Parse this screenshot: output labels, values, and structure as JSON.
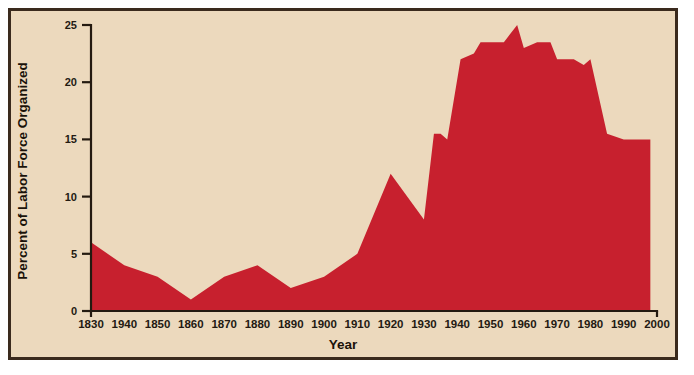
{
  "figure": {
    "background_color": "#ecd9bd",
    "border_color": "#3a2a1d",
    "series_color": "#c7202e",
    "axis_color": "#241a10"
  },
  "chart_data": {
    "type": "area",
    "title": "",
    "xlabel": "Year",
    "ylabel": "Percent of Labor Force Organized",
    "xlim": [
      1830,
      2000
    ],
    "ylim": [
      0,
      25
    ],
    "grid": false,
    "legend": null,
    "xticks": [
      1830,
      1940,
      1850,
      1860,
      1870,
      1880,
      1890,
      1900,
      1910,
      1920,
      1930,
      1940,
      1950,
      1960,
      1970,
      1980,
      1990,
      2000
    ],
    "xtick_labels": [
      "1830",
      "1940",
      "1850",
      "1860",
      "1870",
      "1880",
      "1890",
      "1900",
      "1910",
      "1920",
      "1930",
      "1940",
      "1950",
      "1960",
      "1970",
      "1980",
      "1990",
      "2000"
    ],
    "xtick_note": "Second tick is printed as 1940 in the source image; positionally it is 1840.",
    "yticks": [
      0,
      5,
      10,
      15,
      20,
      25
    ],
    "ytick_labels": [
      "0",
      "5",
      "10",
      "15",
      "20",
      "25"
    ],
    "x": [
      1830,
      1840,
      1850,
      1860,
      1870,
      1880,
      1890,
      1900,
      1910,
      1920,
      1930,
      1933,
      1935,
      1937,
      1941,
      1945,
      1947,
      1954,
      1958,
      1960,
      1964,
      1968,
      1970,
      1975,
      1978,
      1980,
      1985,
      1990,
      1998
    ],
    "values": [
      6.0,
      4.0,
      3.0,
      1.0,
      3.0,
      4.0,
      2.0,
      3.0,
      5.0,
      12.0,
      8.0,
      15.5,
      15.5,
      15.0,
      22.0,
      22.5,
      23.5,
      23.5,
      25.0,
      23.0,
      23.5,
      23.5,
      22.0,
      22.0,
      21.5,
      22.0,
      15.5,
      15.0,
      15.0
    ],
    "series": [
      {
        "name": "Percent of Labor Force Organized",
        "color": "#c7202e",
        "values": [
          6.0,
          4.0,
          3.0,
          1.0,
          3.0,
          4.0,
          2.0,
          3.0,
          5.0,
          12.0,
          8.0,
          15.5,
          15.5,
          15.0,
          22.0,
          22.5,
          23.5,
          23.5,
          25.0,
          23.0,
          23.5,
          23.5,
          22.0,
          22.0,
          21.5,
          22.0,
          15.5,
          15.0,
          15.0
        ]
      }
    ]
  }
}
